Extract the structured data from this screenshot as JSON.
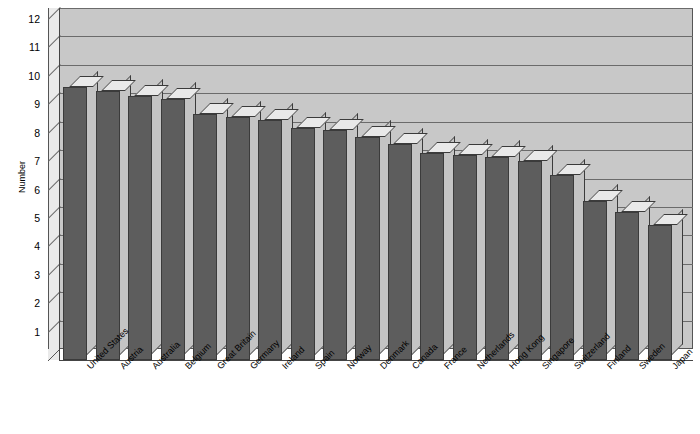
{
  "chart_data": {
    "type": "bar",
    "title": "",
    "subtitle": "",
    "xlabel": "",
    "ylabel": "Number",
    "ylim": [
      0,
      12
    ],
    "ytick_labels": [
      "12",
      "11",
      "10",
      "9",
      "8",
      "7",
      "6",
      "5",
      "4",
      "3",
      "2",
      "1"
    ],
    "yticks": [
      12,
      11,
      10,
      9,
      8,
      7,
      6,
      5,
      4,
      3,
      2,
      1
    ],
    "grid": true,
    "legend": false,
    "legend_position": "none",
    "style": "3d-bar",
    "categories": [
      "United States",
      "Austria",
      "Australia",
      "Belgium",
      "Great Britain",
      "Germany",
      "Ireland",
      "Spain",
      "Norway",
      "Denmark",
      "Canada",
      "France",
      "Netherlands",
      "Hong Kong",
      "Singapore",
      "Switzerland",
      "Finland",
      "Sweden",
      "Japan"
    ],
    "values": [
      9.6,
      9.45,
      9.3,
      9.2,
      8.65,
      8.55,
      8.45,
      8.15,
      8.1,
      7.85,
      7.6,
      7.3,
      7.2,
      7.15,
      7.0,
      6.5,
      5.6,
      5.2,
      4.75
    ]
  },
  "colors": {
    "bar_front": "#5d5d5d",
    "bar_top": "#e9e9e9",
    "bar_side": "#c4c4c4",
    "back_wall": "#c8c8c8",
    "side_wall": "#eaeaea",
    "gridline": "#6b6b6b",
    "axis": "#444444",
    "text": "#000000",
    "background": "#ffffff"
  }
}
